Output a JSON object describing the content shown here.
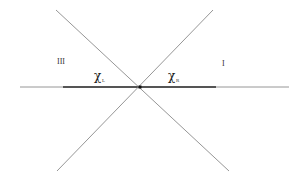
{
  "diagram": {
    "title": "",
    "colors": {
      "background": "#ffffff",
      "thin_line": "#8a8a8a",
      "thick_segment": "#555555",
      "center_point": "#111111",
      "text": "#222222"
    },
    "regions": [
      {
        "id": "region-III",
        "label": "III",
        "x": 57,
        "y": 64
      },
      {
        "id": "region-I",
        "label": "I",
        "x": 222,
        "y": 66
      }
    ],
    "segment_labels": [
      {
        "id": "chi-left",
        "symbol": "χ",
        "subscript": "L",
        "x": 94,
        "y": 80
      },
      {
        "id": "chi-right",
        "symbol": "χ",
        "subscript": "R",
        "x": 168,
        "y": 80
      }
    ],
    "lines": {
      "horizontal_axis": {
        "x1": 20,
        "y1": 87,
        "x2": 289,
        "y2": 87
      },
      "thick_segment": {
        "x1": 63,
        "y1": 87,
        "x2": 216,
        "y2": 87
      },
      "diagonal_down": {
        "x1": 56,
        "y1": 10,
        "x2": 229,
        "y2": 171
      },
      "diagonal_up": {
        "x1": 213,
        "y1": 10,
        "x2": 57,
        "y2": 171
      }
    },
    "center_point": {
      "x": 140,
      "y": 87
    }
  }
}
